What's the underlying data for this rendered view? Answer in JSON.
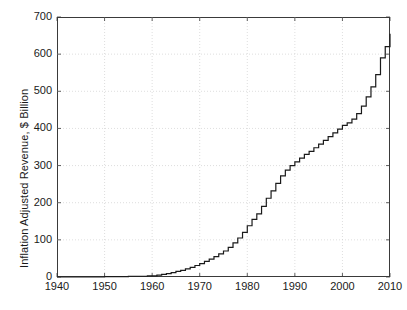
{
  "chart_data": {
    "type": "line",
    "subtype": "step-post",
    "title": "",
    "xlabel": "",
    "ylabel": "Inflation Adjusted Revenue, $ Billion",
    "xlim": [
      1940,
      2010
    ],
    "ylim": [
      0,
      700
    ],
    "xticks": [
      1940,
      1950,
      1960,
      1970,
      1980,
      1990,
      2000,
      2010
    ],
    "yticks": [
      0,
      100,
      200,
      300,
      400,
      500,
      600,
      700
    ],
    "xtick_labels": [
      "1940",
      "1950",
      "1960",
      "1970",
      "1980",
      "1990",
      "2000",
      "2010"
    ],
    "ytick_labels": [
      "0",
      "100",
      "200",
      "300",
      "400",
      "500",
      "600",
      "700"
    ],
    "grid": true,
    "grid_style": "dotted",
    "grid_color": "#c8c8c8",
    "legend": null,
    "line_color": "#1a1a1a",
    "line_width": 1.2,
    "background": "#ffffff",
    "frame_color": "#3a3a3a",
    "x": [
      1940,
      1941,
      1942,
      1943,
      1944,
      1945,
      1946,
      1947,
      1948,
      1949,
      1950,
      1951,
      1952,
      1953,
      1954,
      1955,
      1956,
      1957,
      1958,
      1959,
      1960,
      1961,
      1962,
      1963,
      1964,
      1965,
      1966,
      1967,
      1968,
      1969,
      1970,
      1971,
      1972,
      1973,
      1974,
      1975,
      1976,
      1977,
      1978,
      1979,
      1980,
      1981,
      1982,
      1983,
      1984,
      1985,
      1986,
      1987,
      1988,
      1989,
      1990,
      1991,
      1992,
      1993,
      1994,
      1995,
      1996,
      1997,
      1998,
      1999,
      2000,
      2001,
      2002,
      2003,
      2004,
      2005,
      2006,
      2007,
      2008,
      2009,
      2010
    ],
    "y": [
      0,
      0,
      0,
      0,
      0,
      0,
      0,
      0,
      0,
      0,
      1,
      1,
      1,
      1,
      1,
      2,
      2,
      2,
      2,
      3,
      3,
      5,
      7,
      9,
      12,
      15,
      18,
      22,
      26,
      31,
      36,
      42,
      48,
      55,
      62,
      70,
      80,
      92,
      105,
      120,
      138,
      155,
      170,
      190,
      212,
      232,
      252,
      272,
      288,
      300,
      310,
      320,
      330,
      338,
      348,
      358,
      368,
      378,
      388,
      398,
      408,
      415,
      425,
      440,
      460,
      485,
      512,
      545,
      590,
      620,
      655
    ],
    "series_name": "Inflation Adjusted Revenue",
    "units": "$ Billion",
    "n_points": 71,
    "peak_value": 655,
    "peak_year": 2010
  }
}
